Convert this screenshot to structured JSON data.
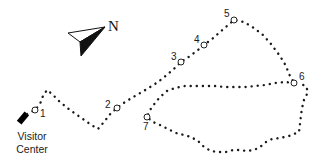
{
  "map": {
    "compass": {
      "label": "N"
    },
    "start": {
      "label_line1": "Visitor",
      "label_line2": "Center"
    },
    "stops": [
      {
        "id": "1",
        "label": "1",
        "x": 35,
        "y": 110
      },
      {
        "id": "2",
        "label": "2",
        "x": 117,
        "y": 108
      },
      {
        "id": "3",
        "label": "3",
        "x": 181,
        "y": 62
      },
      {
        "id": "4",
        "label": "4",
        "x": 204,
        "y": 45
      },
      {
        "id": "5",
        "label": "5",
        "x": 234,
        "y": 20
      },
      {
        "id": "6",
        "label": "6",
        "x": 294,
        "y": 83
      },
      {
        "id": "7",
        "label": "7",
        "x": 147,
        "y": 117
      }
    ],
    "colors": {
      "trail": "#1a1a1a",
      "marker": "#000000",
      "background": "#ffffff"
    }
  }
}
